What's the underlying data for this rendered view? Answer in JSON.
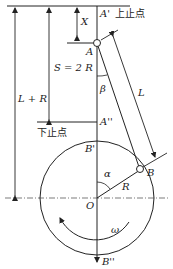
{
  "diagram": {
    "labels": {
      "top_dead_center": "上止点",
      "bottom_dead_center": "下止点",
      "A_prime": "A'",
      "A": "A",
      "A_double_prime": "A''",
      "B": "B",
      "B_prime": "B'",
      "B_double_prime": "B''",
      "O": "O",
      "X": "X",
      "stroke": "S = 2 R",
      "L_plus_R": "L + R",
      "L": "L",
      "R": "R",
      "alpha": "α",
      "beta": "β",
      "omega": "ω"
    },
    "colors": {
      "line": "#222222",
      "background": "#ffffff"
    }
  }
}
